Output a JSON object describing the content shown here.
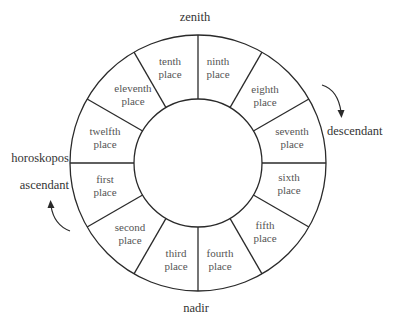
{
  "labels": {
    "zenith": "zenith",
    "nadir": "nadir",
    "horoskopos": "horoskopos",
    "ascendant": "ascendant",
    "descendant": "descendant"
  },
  "places": [
    {
      "line1": "first",
      "line2": "place"
    },
    {
      "line1": "second",
      "line2": "place"
    },
    {
      "line1": "third",
      "line2": "place"
    },
    {
      "line1": "fourth",
      "line2": "place"
    },
    {
      "line1": "fifth",
      "line2": "place"
    },
    {
      "line1": "sixth",
      "line2": "place"
    },
    {
      "line1": "seventh",
      "line2": "place"
    },
    {
      "line1": "eighth",
      "line2": "place"
    },
    {
      "line1": "ninth",
      "line2": "place"
    },
    {
      "line1": "tenth",
      "line2": "place"
    },
    {
      "line1": "eleventh",
      "line2": "place"
    },
    {
      "line1": "twelfth",
      "line2": "place"
    }
  ],
  "colors": {
    "stroke": "#2a2a2a",
    "text": "#555555",
    "background": "#ffffff"
  }
}
